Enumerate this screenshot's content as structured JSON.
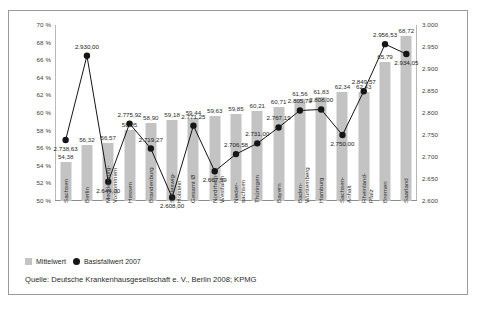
{
  "chart_data": {
    "type": "bar",
    "title": "",
    "subtitle": "",
    "xlabel": "",
    "ylabel": "",
    "grid": false,
    "legend_position": "bottom-left",
    "categories": [
      "Sachsen",
      "Berlin",
      "Mecklenburg-\nVorpommern",
      "Hessen",
      "Brandenburg",
      "Schleswig-\nHolstein",
      "Gesamt Ø",
      "Nordrhein-\nWestfalen",
      "Nieder-\nsachsen",
      "Thüringen",
      "Bayern",
      "Baden-\nWürttemberg",
      "Hamburg",
      "Sachsen-\nAnhalt",
      "Rheinland-\nPfalz",
      "Bremen",
      "Saarland"
    ],
    "series": [
      {
        "name": "Mittelwert",
        "type": "bar",
        "axis": "left",
        "color": "#c3c3c3",
        "unit": "%",
        "values": [
          54.38,
          56.32,
          56.57,
          58.05,
          58.9,
          59.18,
          59.44,
          59.63,
          59.85,
          60.21,
          60.71,
          61.56,
          61.83,
          62.34,
          62.43,
          65.79,
          68.72
        ],
        "value_labels": [
          "54,38",
          "56,32",
          "56,57",
          "58,05",
          "58,90",
          "59,18",
          "59,44",
          "59,63",
          "59,85",
          "60,21",
          "60,71",
          "61,56",
          "61,83",
          "62,34",
          "62,43",
          "65,79",
          "68,72"
        ]
      },
      {
        "name": "Basisfallwert 2007",
        "type": "line",
        "axis": "right",
        "color": "#151515",
        "unit": "",
        "values": [
          2738.63,
          2930.0,
          2644.0,
          2775.92,
          2719.27,
          2608.0,
          2771.25,
          2667.59,
          2706.58,
          2731.0,
          2767.19,
          2805.7,
          2808.0,
          2750.0,
          2849.57,
          2956.53,
          2934.05
        ],
        "value_labels": [
          "2.738,63",
          "2.930,00",
          "2.644,00",
          "2.775,92",
          "2.719,27",
          "2.608,00",
          "2.771,25",
          "2.667,59",
          "2.706,58",
          "2.731,00",
          "2.767,19",
          "2.805,70",
          "2.808,00",
          "2.750,00",
          "2.849,57",
          "2.956,53",
          "2.934,05"
        ]
      }
    ],
    "left_axis": {
      "min": 50,
      "max": 70,
      "step": 2,
      "tick_labels": [
        "70 %",
        "68 %",
        "66 %",
        "64 %",
        "62 %",
        "60 %",
        "58 %",
        "56 %",
        "54 %",
        "52 %",
        "50 %"
      ]
    },
    "right_axis": {
      "min": 2600,
      "max": 3000,
      "step": 50,
      "tick_labels": [
        "3.000",
        "2.950",
        "2.900",
        "2.850",
        "2.800",
        "2.750",
        "2.700",
        "2.650",
        "2.600"
      ]
    }
  },
  "legend": {
    "items": [
      {
        "label": "Mittelwert",
        "marker": "bar-swatch-icon"
      },
      {
        "label": "Basisfallwert 2007",
        "marker": "dot-marker-icon"
      }
    ]
  },
  "source": {
    "text": "Quelle: Deutsche Krankenhausgesellschaft e. V., Berlin 2008; KPMG"
  },
  "colors": {
    "bar": "#c3c3c3",
    "line": "#151515",
    "axis": "#8d8d8d",
    "text": "#2b2b2b",
    "border": "#9a9a9a"
  }
}
